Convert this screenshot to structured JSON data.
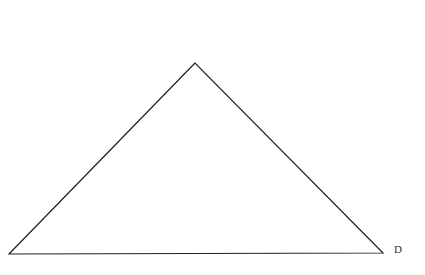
{
  "diagram": {
    "type": "triangle",
    "stroke_color": "#222222",
    "background": "#ffffff",
    "vertices": {
      "apex": {
        "x": 195,
        "y": 63
      },
      "left": {
        "x": 9,
        "y": 254
      },
      "right": {
        "x": 383,
        "y": 253
      }
    },
    "labels": [
      {
        "text": "D",
        "vertex": "right",
        "x": 394,
        "y": 253
      }
    ]
  }
}
